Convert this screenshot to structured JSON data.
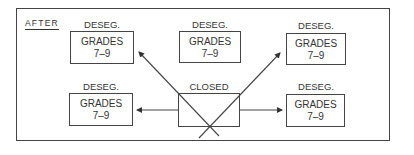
{
  "diagram": {
    "title": "AFTER",
    "nodes": [
      {
        "id": "top-left",
        "label": "DESEG.",
        "line1": "GRADES",
        "line2": "7–9"
      },
      {
        "id": "top-middle",
        "label": "DESEG.",
        "line1": "GRADES",
        "line2": "7–9"
      },
      {
        "id": "top-right",
        "label": "DESEG.",
        "line1": "GRADES",
        "line2": "7–9"
      },
      {
        "id": "bottom-left",
        "label": "DESEG.",
        "line1": "GRADES",
        "line2": "7–9"
      },
      {
        "id": "closed",
        "label": "CLOSED"
      },
      {
        "id": "bottom-right",
        "label": "DESEG.",
        "line1": "GRADES",
        "line2": "7–9"
      }
    ],
    "edges": [
      {
        "from": "closed",
        "to": "top-left"
      },
      {
        "from": "closed",
        "to": "top-right"
      },
      {
        "from": "closed",
        "to": "bottom-left"
      },
      {
        "from": "closed",
        "to": "bottom-right"
      }
    ],
    "colors": {
      "line": "#444444",
      "text": "#333333",
      "background": "#ffffff"
    }
  }
}
